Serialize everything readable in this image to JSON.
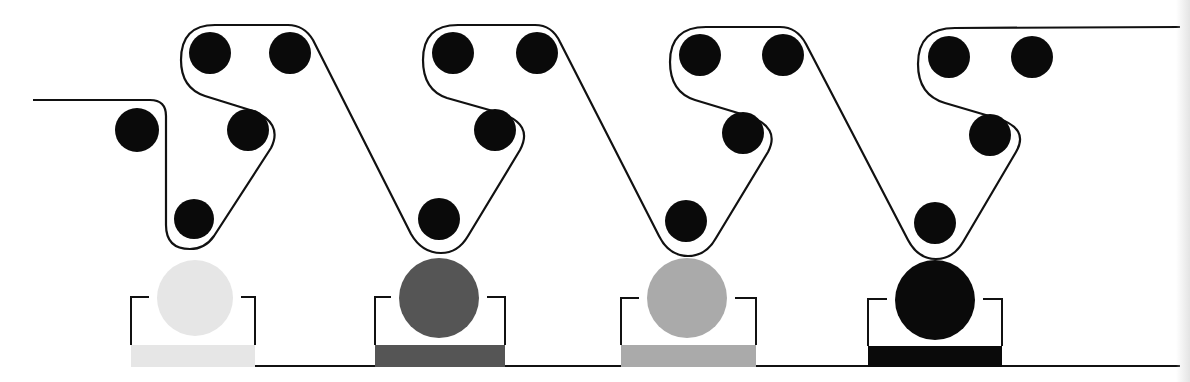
{
  "diagram": {
    "type": "process-schematic",
    "stroke_color": "#111111",
    "roller_color": "#0a0a0a",
    "background": "#ffffff",
    "stations": [
      {
        "id": "station-1",
        "ink_color": "#e6e6e6",
        "ink_name": "light",
        "rollers": [
          {
            "cx": 137,
            "cy": 130,
            "r": 22
          },
          {
            "cx": 210,
            "cy": 53,
            "r": 21
          },
          {
            "cx": 290,
            "cy": 53,
            "r": 21
          },
          {
            "cx": 248,
            "cy": 130,
            "r": 21
          },
          {
            "cx": 194,
            "cy": 219,
            "r": 20
          }
        ],
        "drum": {
          "cx": 195,
          "cy": 298,
          "r": 38
        },
        "tray": {
          "x1": 131,
          "x2": 255,
          "top": 297,
          "bottom": 345,
          "fill_top": 345,
          "fill_bottom": 367
        }
      },
      {
        "id": "station-2",
        "ink_color": "#555555",
        "ink_name": "dark-gray",
        "rollers": [
          {
            "cx": 453,
            "cy": 53,
            "r": 21
          },
          {
            "cx": 537,
            "cy": 53,
            "r": 21
          },
          {
            "cx": 495,
            "cy": 130,
            "r": 21
          },
          {
            "cx": 439,
            "cy": 219,
            "r": 21
          }
        ],
        "drum": {
          "cx": 439,
          "cy": 298,
          "r": 40
        },
        "tray": {
          "x1": 375,
          "x2": 505,
          "top": 297,
          "bottom": 345,
          "fill_top": 345,
          "fill_bottom": 367
        }
      },
      {
        "id": "station-3",
        "ink_color": "#aaaaaa",
        "ink_name": "mid-gray",
        "rollers": [
          {
            "cx": 700,
            "cy": 55,
            "r": 21
          },
          {
            "cx": 783,
            "cy": 55,
            "r": 21
          },
          {
            "cx": 743,
            "cy": 133,
            "r": 21
          },
          {
            "cx": 686,
            "cy": 221,
            "r": 21
          }
        ],
        "drum": {
          "cx": 687,
          "cy": 298,
          "r": 40
        },
        "tray": {
          "x1": 621,
          "x2": 756,
          "top": 298,
          "bottom": 345,
          "fill_top": 345,
          "fill_bottom": 367
        }
      },
      {
        "id": "station-4",
        "ink_color": "#0a0a0a",
        "ink_name": "black",
        "rollers": [
          {
            "cx": 949,
            "cy": 57,
            "r": 21
          },
          {
            "cx": 1032,
            "cy": 57,
            "r": 21
          },
          {
            "cx": 990,
            "cy": 135,
            "r": 21
          },
          {
            "cx": 935,
            "cy": 223,
            "r": 21
          }
        ],
        "drum": {
          "cx": 935,
          "cy": 300,
          "r": 40
        },
        "tray": {
          "x1": 868,
          "x2": 1002,
          "top": 299,
          "bottom": 346,
          "fill_top": 346,
          "fill_bottom": 367
        }
      }
    ],
    "web_path": "M 33 100 L 150 100 Q 166 100 166 116 L 166 225 Q 166 249 190 249 Q 205 249 214 236 L 271 148 Q 284 122 250 110 L 205 96 Q 181 88 181 60 Q 181 25 215 25 L 288 25 Q 304 25 313 40 L 411 234 Q 422 253 441 253 Q 458 253 468 236 L 520 150 Q 534 124 500 113 L 447 98 Q 423 90 423 60 Q 423 25 458 25 L 535 25 Q 552 25 560 42 L 659 236 Q 669 256 688 256 Q 706 256 716 238 L 768 152 Q 781 127 748 116 L 695 100 Q 670 92 670 62 Q 670 27 706 27 L 780 27 Q 797 27 806 44 L 908 240 Q 918 259 936 259 Q 953 259 963 242 L 1016 152 Q 1030 128 996 118 L 945 103 Q 918 95 918 64 Q 918 28 955 28 L 1180 27",
    "base_line": {
      "y": 366,
      "x_start": 255,
      "x_end": 1180
    }
  }
}
